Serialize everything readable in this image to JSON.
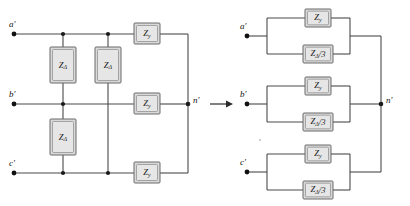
{
  "figure": {
    "background_color": "#ffffff",
    "wire_color": "#4a4a4a",
    "box_fill_color": "#d9d9d9",
    "box_stroke_color": "#6b6b6b",
    "label_color": "#1a1a1a"
  },
  "transform_arrow": {
    "symbol": "→",
    "name": "transformation-arrow"
  },
  "left_circuit": {
    "name": "delta-wye-mixed-network",
    "terminals": [
      {
        "id": "a",
        "label": "a",
        "prime": "′",
        "full": "a′",
        "y": 34
      },
      {
        "id": "b",
        "label": "b",
        "prime": "′",
        "full": "b′",
        "y": 104
      },
      {
        "id": "c",
        "label": "c",
        "prime": "′",
        "full": "c′",
        "y": 173
      }
    ],
    "neutral": {
      "id": "n",
      "label": "n",
      "prime": "′",
      "full": "n′"
    },
    "delta_impedances": [
      {
        "id": "z-delta-ab",
        "base": "Z",
        "sub": "Δ",
        "full": "ZΔ",
        "position": "column-1-top"
      },
      {
        "id": "z-delta-ac",
        "base": "Z",
        "sub": "Δ",
        "full": "ZΔ",
        "position": "column-2-top"
      },
      {
        "id": "z-delta-bc",
        "base": "Z",
        "sub": "Δ",
        "full": "ZΔ",
        "position": "column-1-bottom"
      }
    ],
    "wye_impedances": [
      {
        "id": "z-y-a",
        "base": "Z",
        "sub": "y",
        "full": "Zy",
        "position": "series-a"
      },
      {
        "id": "z-y-b",
        "base": "Z",
        "sub": "y",
        "full": "Zy",
        "position": "series-b"
      },
      {
        "id": "z-y-c",
        "base": "Z",
        "sub": "y",
        "full": "Zy",
        "position": "series-c"
      }
    ]
  },
  "right_circuit": {
    "name": "parallel-equivalent-network",
    "terminals": [
      {
        "id": "a",
        "label": "a",
        "prime": "′",
        "full": "a′",
        "y": 36
      },
      {
        "id": "b",
        "label": "b",
        "prime": "′",
        "full": "b′",
        "y": 104
      },
      {
        "id": "c",
        "label": "c",
        "prime": "′",
        "full": "c′",
        "y": 172
      }
    ],
    "neutral": {
      "id": "n",
      "label": "n",
      "prime": "′",
      "full": "n′"
    },
    "branches": [
      {
        "id": "branch-a",
        "top_impedance": {
          "id": "z-y-a",
          "base": "Z",
          "sub": "y",
          "full": "Zy"
        },
        "bottom_impedance": {
          "id": "z-delta-3-a",
          "base": "Z",
          "sub": "Δ",
          "suffix": "/3",
          "full": "ZΔ/3"
        }
      },
      {
        "id": "branch-b",
        "top_impedance": {
          "id": "z-y-b",
          "base": "Z",
          "sub": "y",
          "full": "Zy"
        },
        "bottom_impedance": {
          "id": "z-delta-3-b",
          "base": "Z",
          "sub": "Δ",
          "suffix": "/3",
          "full": "ZΔ/3"
        }
      },
      {
        "id": "branch-c",
        "top_impedance": {
          "id": "z-y-c",
          "base": "Z",
          "sub": "y",
          "full": "Zy"
        },
        "bottom_impedance": {
          "id": "z-delta-3-c",
          "base": "Z",
          "sub": "Δ",
          "suffix": "/3",
          "full": "ZΔ/3"
        }
      }
    ]
  }
}
